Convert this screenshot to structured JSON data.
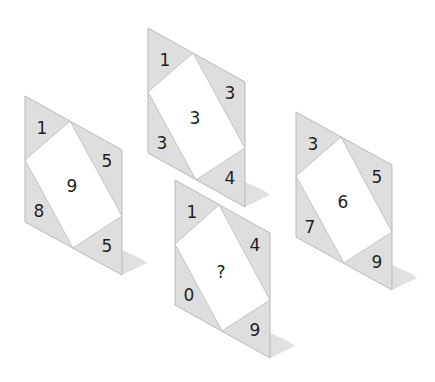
{
  "puzzle": {
    "type": "number-tile-puzzle",
    "colors": {
      "tile_fill": "#dedede",
      "tile_border": "#b9b9b9",
      "inner_fill": "#ffffff",
      "shadow": "#d6d6d6",
      "text": "#1e1e1e"
    },
    "panels": [
      {
        "id": "left",
        "origin": [
          25,
          96
        ],
        "corners": {
          "top_left": "1",
          "top_right": "5",
          "bottom_left": "8",
          "bottom_right": "5"
        },
        "center": "9"
      },
      {
        "id": "top",
        "origin": [
          148,
          28
        ],
        "corners": {
          "top_left": "1",
          "top_right": "3",
          "bottom_left": "3",
          "bottom_right": "4"
        },
        "center": "3"
      },
      {
        "id": "middle",
        "origin": [
          175,
          180
        ],
        "corners": {
          "top_left": "1",
          "top_right": "4",
          "bottom_left": "0",
          "bottom_right": "9"
        },
        "center": "?"
      },
      {
        "id": "right",
        "origin": [
          296,
          112
        ],
        "corners": {
          "top_left": "3",
          "top_right": "5",
          "bottom_left": "7",
          "bottom_right": "9"
        },
        "center": "6"
      }
    ]
  }
}
